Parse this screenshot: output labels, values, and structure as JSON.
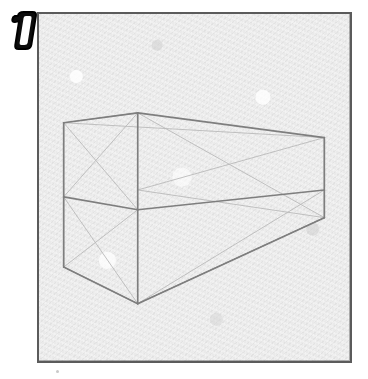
{
  "page": {
    "background_color": "#ffffff",
    "width": 368,
    "height": 379
  },
  "badge": {
    "label": "1",
    "style": "bold-italic-outlined",
    "fill_color": "#111111",
    "outline_color": "#000000",
    "inner_color": "#ffffff"
  },
  "frame": {
    "name": "drawing-panel",
    "border_color": "#5b5b5b",
    "paper_color": "#eaeaea",
    "x": 37,
    "y": 12,
    "width": 315,
    "height": 351
  },
  "drawing": {
    "title": "Two-point perspective box with construction diagonals",
    "medium": "pencil on textured paper",
    "stroke_dark": "#8a8a8a",
    "stroke_light": "#b4b4b4",
    "vertices": {
      "front_top": "137,112",
      "front_bottom": "137,305",
      "left_top_near": "62,122",
      "left_top_far": "62,197",
      "left_bottom_near": "63,268",
      "right_top": "326,137",
      "right_mid": "326,190",
      "right_bottom": "326,218"
    },
    "edge_count": 24,
    "faces": [
      "left-face",
      "right-face",
      "top-face",
      "bottom-face"
    ]
  },
  "annotations": {
    "exercise_number": "1"
  }
}
